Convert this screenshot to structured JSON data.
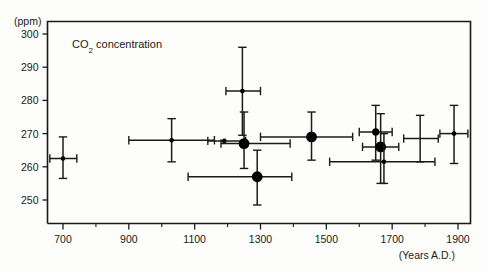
{
  "chart_data": {
    "type": "scatter",
    "title": "CO2 concentration",
    "title_display": "CO",
    "title_sub": "2",
    "title_rest": " concentration",
    "xlabel": "(Years A.D.)",
    "ylabel": "(ppm)",
    "xlim": [
      600,
      1960
    ],
    "ylim": [
      245,
      302
    ],
    "grid": false,
    "legend": null,
    "xticks": [
      700,
      900,
      1100,
      1300,
      1500,
      1700,
      1900
    ],
    "yticks": [
      250,
      260,
      270,
      280,
      290,
      300
    ],
    "xtick_labels": [
      "700",
      "900",
      "1100",
      "1300",
      "1500",
      "1700",
      "1900"
    ],
    "ytick_labels": [
      "250",
      "260",
      "270",
      "280",
      "290",
      "300"
    ],
    "marker_note": "Filled circles; large circles indicate primary measurements, small circles secondary. Horizontal bars = age uncertainty, vertical bars = concentration uncertainty.",
    "points": [
      {
        "id": "p1",
        "x": 700,
        "y": 262.5,
        "xerr_lo": 660,
        "xerr_hi": 742,
        "yerr_lo": 256.5,
        "yerr_hi": 269.0,
        "size": "small"
      },
      {
        "id": "p2",
        "x": 1030,
        "y": 268.0,
        "xerr_lo": 900,
        "xerr_hi": 1160,
        "yerr_lo": 261.5,
        "yerr_hi": 274.5,
        "size": "small"
      },
      {
        "id": "p3",
        "x": 1190,
        "y": 267.8,
        "xerr_lo": 1140,
        "xerr_hi": 1255,
        "yerr_lo": 267.8,
        "yerr_hi": 267.8,
        "size": "small"
      },
      {
        "id": "p4",
        "x": 1250,
        "y": 267.0,
        "xerr_lo": 1180,
        "xerr_hi": 1390,
        "yerr_lo": 259.5,
        "yerr_hi": 276.5,
        "size": "large"
      },
      {
        "id": "p5",
        "x": 1245,
        "y": 282.8,
        "xerr_lo": 1195,
        "xerr_hi": 1300,
        "yerr_lo": 269.5,
        "yerr_hi": 296.0,
        "size": "small"
      },
      {
        "id": "p6",
        "x": 1290,
        "y": 257.0,
        "xerr_lo": 1080,
        "xerr_hi": 1395,
        "yerr_lo": 248.5,
        "yerr_hi": 265.0,
        "size": "large"
      },
      {
        "id": "p7",
        "x": 1455,
        "y": 269.0,
        "xerr_lo": 1300,
        "xerr_hi": 1580,
        "yerr_lo": 262.0,
        "yerr_hi": 276.5,
        "size": "large"
      },
      {
        "id": "p8",
        "x": 1650,
        "y": 270.5,
        "xerr_lo": 1600,
        "xerr_hi": 1700,
        "yerr_lo": 262.0,
        "yerr_hi": 278.5,
        "size": "medium"
      },
      {
        "id": "p9",
        "x": 1665,
        "y": 266.0,
        "xerr_lo": 1610,
        "xerr_hi": 1720,
        "yerr_lo": 255.0,
        "yerr_hi": 276.0,
        "size": "large"
      },
      {
        "id": "p10",
        "x": 1675,
        "y": 261.5,
        "xerr_lo": 1510,
        "xerr_hi": 1830,
        "yerr_lo": 255.0,
        "yerr_hi": 270.0,
        "size": "small"
      },
      {
        "id": "p11",
        "x": 1785,
        "y": 268.5,
        "xerr_lo": 1735,
        "xerr_hi": 1840,
        "yerr_lo": 261.5,
        "yerr_hi": 275.5,
        "size": "none"
      },
      {
        "id": "p12",
        "x": 1888,
        "y": 270.0,
        "xerr_lo": 1845,
        "xerr_hi": 1930,
        "yerr_lo": 261.0,
        "yerr_hi": 278.5,
        "size": "small"
      }
    ],
    "colors": {
      "axis": "#1a1a1a",
      "marker": "#000000",
      "errorbar": "#1a1a1a",
      "background": "#fdfdfb"
    }
  }
}
